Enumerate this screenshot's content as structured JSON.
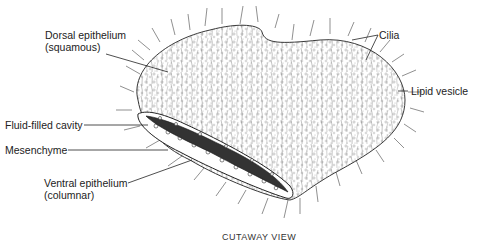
{
  "diagram": {
    "caption": "CUTAWAY   VIEW",
    "labels": {
      "dorsal_line1": "Dorsal epithelium",
      "dorsal_line2": "(squamous)",
      "cilia": "Cilia",
      "lipid": "Lipid vesicle",
      "fluid": "Fluid-filled cavity",
      "mesenchyme": "Mesenchyme",
      "ventral_line1": "Ventral epithelium",
      "ventral_line2": "(columnar)"
    },
    "colors": {
      "ink": "#222222",
      "stipple": "#888888",
      "background": "#ffffff"
    }
  }
}
